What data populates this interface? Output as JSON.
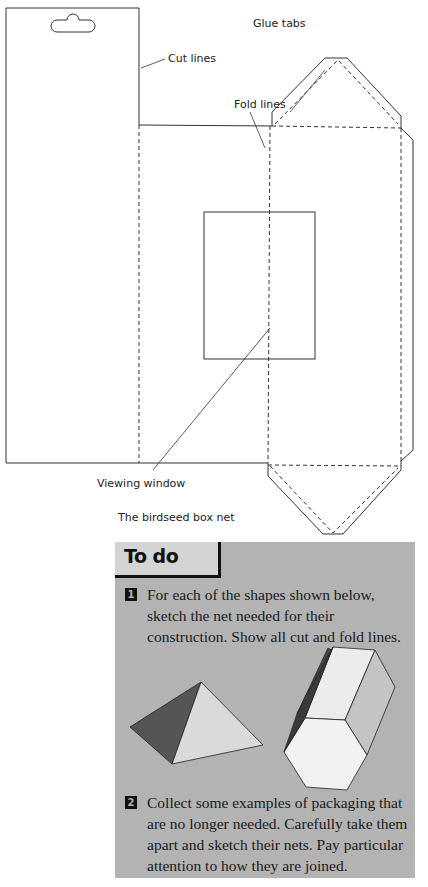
{
  "diagram": {
    "caption": "The birdseed box net",
    "labels": {
      "cut_lines": "Cut lines",
      "fold_lines": "Fold lines",
      "glue_tabs": "Glue tabs",
      "viewing_window": "Viewing window"
    },
    "line_styles": {
      "cut": "solid",
      "fold": "dashed"
    },
    "colors": {
      "line": "#333333",
      "background": "#ffffff"
    }
  },
  "todo": {
    "title": "To do",
    "background": "#b3b3b3",
    "tasks": [
      {
        "number": "1",
        "text": "For each of the shapes shown below, sketch the net needed for their construction. Show all cut and fold lines."
      },
      {
        "number": "2",
        "text": "Collect some examples of packaging that are no longer needed. Carefully take them apart and sketch their nets. Pay particular attention to how they are joined."
      }
    ],
    "shapes": [
      "square-based pyramid",
      "hexagonal prism"
    ]
  }
}
